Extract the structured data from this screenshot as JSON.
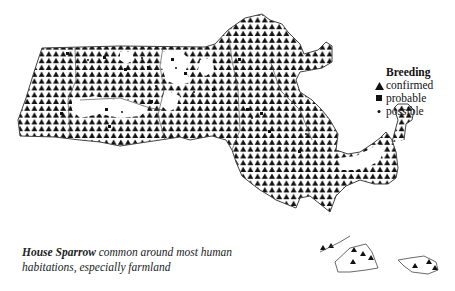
{
  "map": {
    "title": "Massachusetts breeding distribution map",
    "colors": {
      "symbol": "#111111",
      "outline": "#444444",
      "background": "#ffffff"
    }
  },
  "legend": {
    "title": "Breeding",
    "items": [
      {
        "symbol": "triangle",
        "label": "confirmed"
      },
      {
        "symbol": "square",
        "label": "probable"
      },
      {
        "symbol": "dot",
        "label": "possible"
      }
    ]
  },
  "caption": {
    "species": "House Sparrow",
    "text_line1": " common around most human",
    "text_line2": "habitations, especially farmland"
  }
}
